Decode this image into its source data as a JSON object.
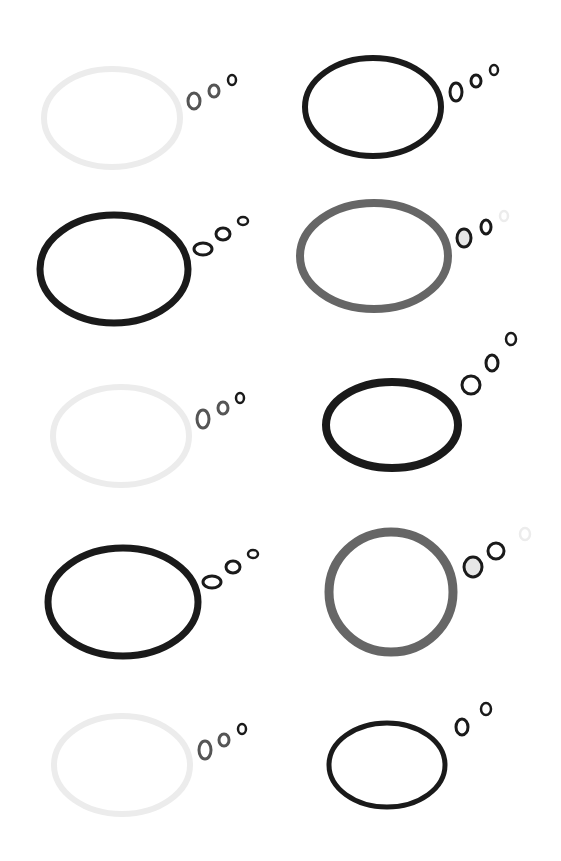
{
  "canvas": {
    "width": 561,
    "height": 861,
    "background": "#ffffff"
  },
  "colors": {
    "black": "#1a1a1a",
    "gray": "#666666",
    "light": "#ececec",
    "dot_gray": "#555555",
    "fill_light": "#e6e6e6"
  },
  "bubbles": [
    {
      "id": "bubble-1",
      "cx": 112,
      "cy": 118,
      "rx": 68,
      "ry": 49,
      "stroke": "#ececec",
      "sw": 6,
      "dots": [
        {
          "cx": 194,
          "cy": 101,
          "rx": 6,
          "ry": 8,
          "stroke": "#555555",
          "sw": 3
        },
        {
          "cx": 214,
          "cy": 91,
          "rx": 5,
          "ry": 6,
          "stroke": "#555555",
          "sw": 3
        },
        {
          "cx": 232,
          "cy": 80,
          "rx": 4,
          "ry": 5,
          "stroke": "#1a1a1a",
          "sw": 2.5
        }
      ]
    },
    {
      "id": "bubble-2",
      "cx": 373,
      "cy": 107,
      "rx": 68,
      "ry": 49,
      "stroke": "#1a1a1a",
      "sw": 6,
      "dots": [
        {
          "cx": 456,
          "cy": 92,
          "rx": 6,
          "ry": 9,
          "stroke": "#1a1a1a",
          "sw": 3
        },
        {
          "cx": 476,
          "cy": 81,
          "rx": 5,
          "ry": 6,
          "stroke": "#1a1a1a",
          "sw": 3
        },
        {
          "cx": 494,
          "cy": 70,
          "rx": 4,
          "ry": 5,
          "stroke": "#1a1a1a",
          "sw": 2.5
        }
      ]
    },
    {
      "id": "bubble-3",
      "cx": 114,
      "cy": 269,
      "rx": 74,
      "ry": 54,
      "stroke": "#1a1a1a",
      "sw": 7,
      "dots": [
        {
          "cx": 203,
          "cy": 249,
          "rx": 9,
          "ry": 6,
          "stroke": "#1a1a1a",
          "sw": 3
        },
        {
          "cx": 223,
          "cy": 234,
          "rx": 7,
          "ry": 6,
          "stroke": "#1a1a1a",
          "sw": 3
        },
        {
          "cx": 243,
          "cy": 221,
          "rx": 5,
          "ry": 4,
          "stroke": "#1a1a1a",
          "sw": 2.5
        }
      ]
    },
    {
      "id": "bubble-4",
      "cx": 374,
      "cy": 256,
      "rx": 74,
      "ry": 53,
      "stroke": "#666666",
      "sw": 8,
      "dots": [
        {
          "cx": 464,
          "cy": 238,
          "rx": 7,
          "ry": 9,
          "stroke": "#1a1a1a",
          "sw": 3,
          "fill": "#e6e6e6"
        },
        {
          "cx": 486,
          "cy": 227,
          "rx": 5,
          "ry": 7,
          "stroke": "#1a1a1a",
          "sw": 3
        },
        {
          "cx": 504,
          "cy": 216,
          "rx": 4,
          "ry": 5,
          "stroke": "#ececec",
          "sw": 2.5
        }
      ]
    },
    {
      "id": "bubble-5",
      "cx": 121,
      "cy": 436,
      "rx": 68,
      "ry": 49,
      "stroke": "#ececec",
      "sw": 6,
      "dots": [
        {
          "cx": 203,
          "cy": 419,
          "rx": 6,
          "ry": 9,
          "stroke": "#555555",
          "sw": 3
        },
        {
          "cx": 223,
          "cy": 408,
          "rx": 5,
          "ry": 6,
          "stroke": "#555555",
          "sw": 3
        },
        {
          "cx": 240,
          "cy": 398,
          "rx": 4,
          "ry": 5,
          "stroke": "#1a1a1a",
          "sw": 2.5
        }
      ]
    },
    {
      "id": "bubble-6",
      "cx": 392,
      "cy": 425,
      "rx": 66,
      "ry": 43,
      "stroke": "#1a1a1a",
      "sw": 8,
      "dots": [
        {
          "cx": 471,
          "cy": 385,
          "rx": 9,
          "ry": 9,
          "stroke": "#1a1a1a",
          "sw": 3
        },
        {
          "cx": 492,
          "cy": 363,
          "rx": 6,
          "ry": 8,
          "stroke": "#1a1a1a",
          "sw": 3
        },
        {
          "cx": 511,
          "cy": 339,
          "rx": 5,
          "ry": 6,
          "stroke": "#1a1a1a",
          "sw": 2.5
        }
      ]
    },
    {
      "id": "bubble-7",
      "cx": 123,
      "cy": 602,
      "rx": 75,
      "ry": 54,
      "stroke": "#1a1a1a",
      "sw": 7,
      "dots": [
        {
          "cx": 212,
          "cy": 582,
          "rx": 9,
          "ry": 6,
          "stroke": "#1a1a1a",
          "sw": 3
        },
        {
          "cx": 233,
          "cy": 567,
          "rx": 7,
          "ry": 6,
          "stroke": "#1a1a1a",
          "sw": 3
        },
        {
          "cx": 253,
          "cy": 554,
          "rx": 5,
          "ry": 4,
          "stroke": "#1a1a1a",
          "sw": 2.5
        }
      ]
    },
    {
      "id": "bubble-8",
      "cx": 391,
      "cy": 592,
      "rx": 62,
      "ry": 60,
      "stroke": "#666666",
      "sw": 9,
      "dots": [
        {
          "cx": 473,
          "cy": 567,
          "rx": 9,
          "ry": 10,
          "stroke": "#1a1a1a",
          "sw": 3,
          "fill": "#e6e6e6"
        },
        {
          "cx": 496,
          "cy": 551,
          "rx": 8,
          "ry": 8,
          "stroke": "#1a1a1a",
          "sw": 3
        },
        {
          "cx": 525,
          "cy": 534,
          "rx": 5,
          "ry": 6,
          "stroke": "#ececec",
          "sw": 2.5
        }
      ]
    },
    {
      "id": "bubble-9",
      "cx": 122,
      "cy": 765,
      "rx": 68,
      "ry": 49,
      "stroke": "#ececec",
      "sw": 6,
      "dots": [
        {
          "cx": 205,
          "cy": 750,
          "rx": 6,
          "ry": 9,
          "stroke": "#555555",
          "sw": 3
        },
        {
          "cx": 224,
          "cy": 740,
          "rx": 5,
          "ry": 6,
          "stroke": "#555555",
          "sw": 3
        },
        {
          "cx": 242,
          "cy": 729,
          "rx": 4,
          "ry": 5,
          "stroke": "#1a1a1a",
          "sw": 2.5
        }
      ]
    },
    {
      "id": "bubble-10",
      "cx": 387,
      "cy": 765,
      "rx": 58,
      "ry": 42,
      "stroke": "#1a1a1a",
      "sw": 5,
      "dots": [
        {
          "cx": 462,
          "cy": 727,
          "rx": 6,
          "ry": 8,
          "stroke": "#1a1a1a",
          "sw": 3
        },
        {
          "cx": 486,
          "cy": 709,
          "rx": 5,
          "ry": 6,
          "stroke": "#1a1a1a",
          "sw": 2.5
        }
      ]
    }
  ]
}
